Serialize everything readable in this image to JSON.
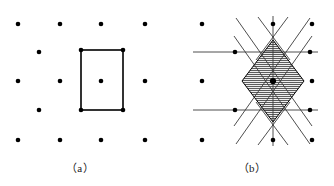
{
  "figure": {
    "background_color": "#ffffff",
    "ink_color": "#000000",
    "line_color": "#3a3a3a",
    "hatch_color": "#2b2b2b",
    "dot_radius": 2.3,
    "width": 334,
    "height": 186
  },
  "panels": [
    {
      "id": "a",
      "caption": "（a）",
      "caption_x": 80,
      "caption_y": 172,
      "description": "centered rectangular lattice with primitive unit cell outlined",
      "lattice_dots": [
        {
          "x": 18,
          "y": 24
        },
        {
          "x": 60,
          "y": 24
        },
        {
          "x": 101,
          "y": 24
        },
        {
          "x": 145,
          "y": 24
        },
        {
          "x": 39,
          "y": 52
        },
        {
          "x": 81,
          "y": 50
        },
        {
          "x": 123,
          "y": 50
        },
        {
          "x": 18,
          "y": 81
        },
        {
          "x": 60,
          "y": 81
        },
        {
          "x": 101,
          "y": 81
        },
        {
          "x": 145,
          "y": 81
        },
        {
          "x": 39,
          "y": 110
        },
        {
          "x": 81,
          "y": 110
        },
        {
          "x": 123,
          "y": 110
        },
        {
          "x": 18,
          "y": 140
        },
        {
          "x": 60,
          "y": 140
        },
        {
          "x": 101,
          "y": 140
        },
        {
          "x": 145,
          "y": 140
        }
      ],
      "unit_cell": {
        "x": 81,
        "y": 50,
        "width": 42,
        "height": 60,
        "stroke_width": 1.6,
        "center_dot": {
          "x": 101,
          "y": 81
        }
      }
    },
    {
      "id": "b",
      "caption": "（b）",
      "caption_x": 252,
      "caption_y": 172,
      "description": "same lattice with Wigner-Seitz cell construction; perpendicular bisectors drawn and central cell hatched",
      "lattice_dots": [
        {
          "x": 202,
          "y": 24
        },
        {
          "x": 273,
          "y": 24
        },
        {
          "x": 312,
          "y": 24
        },
        {
          "x": 235,
          "y": 52
        },
        {
          "x": 310,
          "y": 52
        },
        {
          "x": 202,
          "y": 81
        },
        {
          "x": 273,
          "y": 81
        },
        {
          "x": 312,
          "y": 81
        },
        {
          "x": 235,
          "y": 110
        },
        {
          "x": 310,
          "y": 110
        },
        {
          "x": 202,
          "y": 140
        },
        {
          "x": 273,
          "y": 140
        },
        {
          "x": 312,
          "y": 140
        }
      ],
      "center_dot": {
        "x": 273,
        "y": 81
      },
      "construction_lines": [
        {
          "x1": 193,
          "y1": 52,
          "x2": 318,
          "y2": 52
        },
        {
          "x1": 193,
          "y1": 110,
          "x2": 318,
          "y2": 110
        },
        {
          "x1": 273,
          "y1": 16,
          "x2": 273,
          "y2": 146
        },
        {
          "x1": 236,
          "y1": 18,
          "x2": 312,
          "y2": 126
        },
        {
          "x1": 310,
          "y1": 18,
          "x2": 234,
          "y2": 126
        },
        {
          "x1": 236,
          "y1": 144,
          "x2": 312,
          "y2": 36
        },
        {
          "x1": 310,
          "y1": 144,
          "x2": 234,
          "y2": 36
        },
        {
          "x1": 258,
          "y1": 17,
          "x2": 290,
          "y2": 60
        },
        {
          "x1": 288,
          "y1": 17,
          "x2": 256,
          "y2": 60
        },
        {
          "x1": 258,
          "y1": 145,
          "x2": 290,
          "y2": 102
        },
        {
          "x1": 288,
          "y1": 145,
          "x2": 256,
          "y2": 102
        }
      ],
      "wigner_seitz_cell": {
        "shape": "rhombus",
        "vertices": [
          {
            "x": 273,
            "y": 40
          },
          {
            "x": 304,
            "y": 81
          },
          {
            "x": 273,
            "y": 122
          },
          {
            "x": 242,
            "y": 81
          }
        ],
        "hatch_direction": "horizontal",
        "hatch_spacing": 2
      }
    }
  ]
}
